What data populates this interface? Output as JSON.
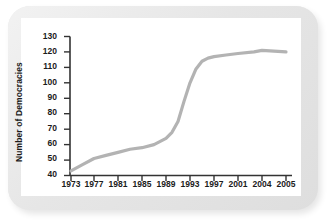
{
  "chart_data": {
    "type": "line",
    "title": "",
    "xlabel": "",
    "ylabel": "Number of Democracies",
    "ylim": [
      40,
      130
    ],
    "ytick_labels": [
      "130",
      "120",
      "110",
      "100",
      "90",
      "80",
      "70",
      "60",
      "50",
      "40"
    ],
    "ytick_values": [
      130,
      120,
      110,
      100,
      90,
      80,
      70,
      60,
      50,
      40
    ],
    "xtick_labels": [
      "1973",
      "1977",
      "1981",
      "1985",
      "1989",
      "1993",
      "1997",
      "2001",
      "2004",
      "2005"
    ],
    "xtick_values": [
      1973,
      1977,
      1981,
      1985,
      1989,
      1993,
      1997,
      2001,
      2004,
      2005
    ],
    "grid": false,
    "legend": "none",
    "series": [
      {
        "name": "Number of Democracies",
        "color": "#b3b3b3",
        "x": [
          1973,
          1975,
          1977,
          1979,
          1981,
          1983,
          1985,
          1987,
          1989,
          1990,
          1991,
          1992,
          1993,
          1994,
          1995,
          1996,
          1997,
          1999,
          2001,
          2003,
          2004,
          2005
        ],
        "values": [
          43,
          47,
          51,
          53,
          55,
          57,
          58,
          60,
          64,
          68,
          75,
          88,
          100,
          109,
          114,
          116,
          117,
          118,
          119,
          120,
          121,
          120
        ]
      }
    ]
  },
  "axis": {
    "line_color": "#333333"
  },
  "frame": {
    "border_color": "#e3e3e3",
    "panel_color": "#ffffff"
  }
}
